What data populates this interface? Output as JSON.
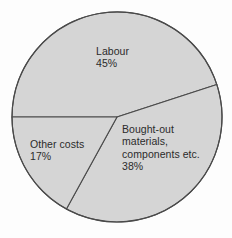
{
  "chart_data": {
    "type": "pie",
    "title": "",
    "subtitle": "",
    "xlabel": "",
    "ylabel": "",
    "legend": "none",
    "grid": false,
    "units": "percent",
    "total": 100,
    "categories": [
      "Labour",
      "Bought-out materials, components etc.",
      "Other costs"
    ],
    "values": [
      45,
      38,
      17
    ],
    "slices": [
      {
        "name": "labour",
        "label": "Labour",
        "value": 45,
        "value_text": "45%",
        "label_text": "Labour\n45%",
        "start_angle": 180,
        "end_angle": 342,
        "sweep": 162,
        "color": "#d5d5d5"
      },
      {
        "name": "bought-out-materials",
        "label": "Bought-out materials, components etc.",
        "value": 38,
        "value_text": "38%",
        "label_text": "Bought-out\nmaterials,\ncomponents etc.\n38%",
        "start_angle": 342,
        "end_angle": 478.8,
        "sweep": 136.8,
        "color": "#d5d5d5"
      },
      {
        "name": "other-costs",
        "label": "Other costs",
        "value": 17,
        "value_text": "17%",
        "label_text": "Other costs\n17%",
        "start_angle": 478.8,
        "end_angle": 540,
        "sweep": 61.2,
        "color": "#d5d5d5"
      }
    ],
    "geometry": {
      "center_x": 117,
      "center_y": 117,
      "radius": 105
    },
    "colors": {
      "slice_fill": "#d5d5d5",
      "stroke": "#4a4a4a",
      "text": "#2b2b2b",
      "background": "#fdfdfd"
    }
  }
}
